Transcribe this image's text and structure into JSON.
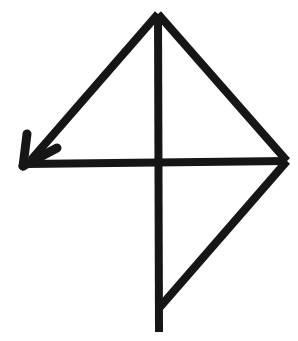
{
  "figure": {
    "canvas": {
      "width": 298,
      "height": 341
    },
    "background_color": "#ffffff",
    "stroke_color": "#161616",
    "stroke_width": 8,
    "points": {
      "apex_top": [
        158,
        14
      ],
      "center": [
        158,
        162
      ],
      "right_vertex": [
        287,
        161
      ],
      "bottom_tip": [
        159,
        332
      ],
      "bottom_junction": [
        160,
        306
      ],
      "arrow_tip": [
        23,
        166
      ]
    },
    "strokes": [
      {
        "name": "vertical-line",
        "description": "Vertical line from top apex down through the center to the bottom tip",
        "from": [
          158,
          14
        ],
        "to": [
          159,
          332
        ]
      },
      {
        "name": "horizontal-line",
        "description": "Horizontal line from the left arrow tip rightward through the center to the right vertex",
        "from": [
          26,
          164
        ],
        "to": [
          287,
          161
        ]
      },
      {
        "name": "upper-left-diagonal",
        "description": "Diagonal from the top apex down-left to the arrow tip",
        "from": [
          158,
          14
        ],
        "to": [
          31,
          160
        ]
      },
      {
        "name": "upper-right-diagonal",
        "description": "Diagonal from the top apex down-right to the right vertex",
        "from": [
          158,
          14
        ],
        "to": [
          287,
          161
        ]
      },
      {
        "name": "lower-right-diagonal",
        "description": "Diagonal from the right vertex down-left to the lower part of the vertical line",
        "from": [
          287,
          161
        ],
        "to": [
          160,
          307
        ]
      }
    ],
    "arrowhead": {
      "name": "left-arrowhead",
      "direction": "left",
      "tip": [
        23,
        166
      ],
      "barbs": [
        {
          "name": "upper-barb",
          "from": [
            23,
            166
          ],
          "to": [
            27,
            134
          ]
        },
        {
          "name": "lower-barb",
          "from": [
            23,
            166
          ],
          "to": [
            57,
            148
          ]
        }
      ]
    },
    "shapes": [
      {
        "name": "upper-left-triangle",
        "vertices": [
          [
            158,
            14
          ],
          [
            158,
            162
          ],
          [
            26,
            164
          ]
        ]
      },
      {
        "name": "upper-right-triangle",
        "vertices": [
          [
            158,
            14
          ],
          [
            287,
            161
          ],
          [
            158,
            162
          ]
        ]
      },
      {
        "name": "lower-right-triangle",
        "vertices": [
          [
            158,
            162
          ],
          [
            287,
            161
          ],
          [
            159,
            307
          ]
        ]
      }
    ]
  }
}
